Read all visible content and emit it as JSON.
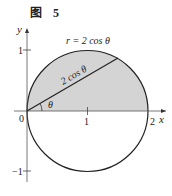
{
  "figure": {
    "title": "图 5",
    "equation_label": "r = 2 cos θ",
    "radius_label": "2 cos θ",
    "angle_label": "θ",
    "axes": {
      "x_label": "x",
      "y_label": "y",
      "origin_label": "0",
      "x_ticks": [
        "1",
        "2"
      ],
      "y_ticks": [
        "1",
        "−1"
      ]
    },
    "colors": {
      "fill": "#d4d4d4",
      "stroke": "#222222",
      "background": "#ffffff"
    }
  }
}
